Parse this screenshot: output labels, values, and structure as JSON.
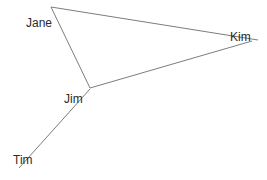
{
  "diagram": {
    "type": "node-link-graph",
    "title": "",
    "background_color": "#ffffff",
    "edge_color": "#7d7d7d",
    "label_color": "#2b2b2b",
    "nodes": [
      {
        "id": "jane",
        "label": "Jane",
        "x": 51,
        "y": 7,
        "label_x": 26,
        "label_y": 17
      },
      {
        "id": "kim",
        "label": "Kim",
        "x": 252,
        "y": 40,
        "label_x": 230,
        "label_y": 31
      },
      {
        "id": "jim",
        "label": "Jim",
        "x": 90,
        "y": 88,
        "label_x": 64,
        "label_y": 93
      },
      {
        "id": "tim",
        "label": "Tim",
        "x": 19,
        "y": 168,
        "label_x": 13,
        "label_y": 154
      }
    ],
    "edges": [
      {
        "id": "jane-kim",
        "from": "Jane",
        "to": "Kim",
        "x1": 51,
        "y1": 7,
        "x2": 258,
        "y2": 40
      },
      {
        "id": "jane-jim",
        "from": "Jane",
        "to": "Jim",
        "x1": 51,
        "y1": 7,
        "x2": 90,
        "y2": 88
      },
      {
        "id": "jim-kim",
        "from": "Jim",
        "to": "Kim",
        "x1": 90,
        "y1": 88,
        "x2": 252,
        "y2": 41
      },
      {
        "id": "jim-tim",
        "from": "Jim",
        "to": "Tim",
        "x1": 90,
        "y1": 89,
        "x2": 19,
        "y2": 168
      }
    ]
  }
}
